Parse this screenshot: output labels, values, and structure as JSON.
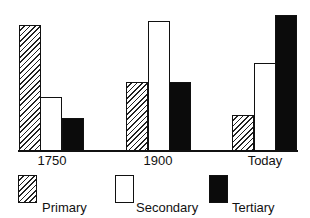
{
  "chart_data": {
    "type": "bar",
    "title": "",
    "xlabel": "",
    "ylabel": "",
    "categories": [
      "1750",
      "1900",
      "Today"
    ],
    "series": [
      {
        "name": "Primary industry",
        "fill": "hatched",
        "values": [
          125,
          68,
          35
        ]
      },
      {
        "name": "Secondary industry",
        "fill": "white",
        "values": [
          53,
          129,
          87
        ]
      },
      {
        "name": "Tertiary industry",
        "fill": "black",
        "values": [
          32,
          68,
          135
        ]
      }
    ],
    "value_units": "relative bar height (no axis scale shown)",
    "ylim": [
      0,
      140
    ],
    "grid": false,
    "legend_position": "bottom"
  },
  "legend": [
    {
      "line1": "Primary",
      "line2": "industry",
      "fill": "hatched"
    },
    {
      "line1": "Secondary",
      "line2": "industry",
      "fill": "white"
    },
    {
      "line1": "Tertiary",
      "line2": "industry",
      "fill": "black"
    }
  ],
  "layout": {
    "baseline_y": 150,
    "groups": [
      {
        "label": "1750",
        "center_x": 52,
        "bar_x": [
          19,
          40,
          62
        ]
      },
      {
        "label": "1900",
        "center_x": 158,
        "bar_x": [
          126,
          148,
          169
        ]
      },
      {
        "label": "Today",
        "center_x": 265,
        "bar_x": [
          232,
          254,
          275
        ]
      }
    ],
    "bar_width": 22
  },
  "colors": {
    "ink": "#111111",
    "background": "#ffffff",
    "tertiary": "#0b0b0b"
  }
}
